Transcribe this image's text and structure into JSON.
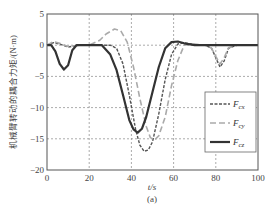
{
  "chart_data": {
    "type": "line",
    "title": "",
    "xlabel": "t/s",
    "ylabel": "机械臂转动的耦合力矩/(N·m)",
    "caption": "(a)",
    "xlim": [
      0,
      100
    ],
    "ylim": [
      -20,
      5
    ],
    "xticks": [
      0,
      20,
      40,
      60,
      80,
      100
    ],
    "yticks": [
      5,
      0,
      -5,
      -10,
      -15,
      -20
    ],
    "grid": true,
    "legend_position": "lower right",
    "series": [
      {
        "name": "F_cx",
        "label_main": "F",
        "label_sub": "cx",
        "style": "dashed",
        "color": "#555555",
        "x": [
          0,
          3,
          6,
          10,
          15,
          20,
          25,
          30,
          33,
          36,
          39,
          42,
          44,
          46,
          48,
          50,
          53,
          56,
          59,
          62,
          65,
          70,
          75,
          78,
          80,
          82,
          84,
          86,
          90,
          95,
          100
        ],
        "y": [
          0,
          0.4,
          0.2,
          -0.3,
          0,
          0,
          0,
          0,
          -0.5,
          -3,
          -8,
          -13.5,
          -16,
          -17,
          -16.8,
          -15.5,
          -11,
          -5.5,
          -1.5,
          0.2,
          0.4,
          0.1,
          0,
          -0.5,
          -2,
          -3.5,
          -2.5,
          -0.5,
          0,
          0,
          0
        ]
      },
      {
        "name": "F_cy",
        "label_main": "F",
        "label_sub": "cy",
        "style": "long-dashed",
        "color": "#aaaaaa",
        "x": [
          0,
          3,
          6,
          10,
          15,
          20,
          25,
          28,
          32,
          35,
          38,
          41,
          44,
          47,
          49,
          51,
          53,
          56,
          59,
          62,
          65,
          70,
          75,
          78,
          80,
          82,
          84,
          86,
          90,
          95,
          100
        ],
        "y": [
          0,
          0.6,
          0.3,
          -0.2,
          0,
          0,
          0.8,
          1.8,
          2.6,
          2.3,
          0.5,
          -3.5,
          -8.5,
          -13,
          -14.8,
          -15.2,
          -14.5,
          -11.5,
          -6.5,
          -2.5,
          0,
          0.2,
          0,
          -0.5,
          -1.8,
          -3,
          -2,
          -0.4,
          0,
          0,
          0
        ]
      },
      {
        "name": "F_cz",
        "label_main": "F",
        "label_sub": "cz",
        "style": "solid",
        "color": "#333333",
        "x": [
          0,
          2,
          4,
          6,
          8,
          10,
          12,
          14,
          18,
          22,
          26,
          30,
          33,
          36,
          39,
          41,
          43,
          45,
          47,
          50,
          53,
          56,
          59,
          62,
          65,
          70,
          80,
          90,
          100
        ],
        "y": [
          0,
          0,
          -1,
          -3,
          -3.9,
          -3.2,
          -0.8,
          0,
          0,
          0,
          0,
          -1.5,
          -4,
          -8,
          -12,
          -13.5,
          -14,
          -13.4,
          -11.5,
          -7.5,
          -3.5,
          -0.5,
          0.5,
          0.6,
          0.3,
          0,
          0,
          0,
          0
        ]
      }
    ]
  }
}
